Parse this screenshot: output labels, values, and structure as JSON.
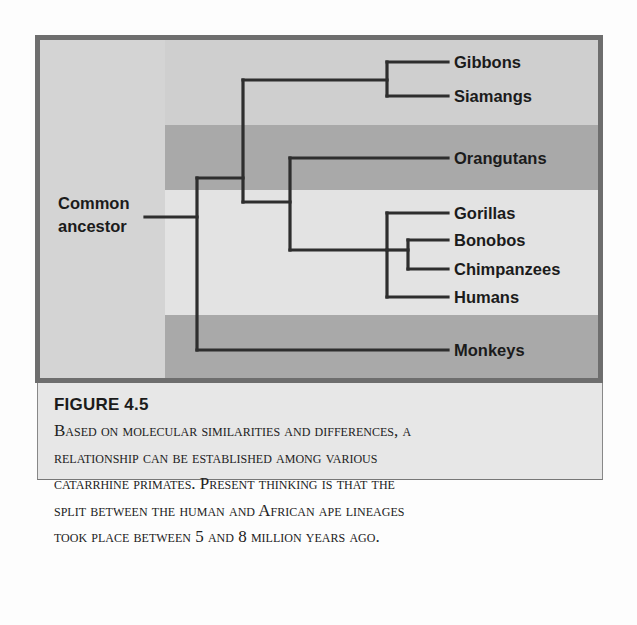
{
  "figure": {
    "number_label": "FIGURE 4.5",
    "caption_lines": [
      "Based on molecular similarities and differences, a",
      "relationship can be established among various",
      "catarrhine primates. Present thinking is that the",
      "split between the human and African ape lineages",
      "took place between 5 and 8 million years ago."
    ]
  },
  "tree": {
    "root_label_line1": "Common",
    "root_label_line2": "ancestor",
    "leaves": [
      {
        "id": "gibbons",
        "label": "Gibbons"
      },
      {
        "id": "siamangs",
        "label": "Siamangs"
      },
      {
        "id": "orangutans",
        "label": "Orangutans"
      },
      {
        "id": "gorillas",
        "label": "Gorillas"
      },
      {
        "id": "bonobos",
        "label": "Bonobos"
      },
      {
        "id": "chimpanzees",
        "label": "Chimpanzees"
      },
      {
        "id": "humans",
        "label": "Humans"
      },
      {
        "id": "monkeys",
        "label": "Monkeys"
      }
    ],
    "colors": {
      "frame": "#6e6e6e",
      "line": "#2e2e2e",
      "band_light": "#cfcfcf",
      "band_dark": "#a9a9a9",
      "band_pale": "#e3e3e3"
    }
  }
}
